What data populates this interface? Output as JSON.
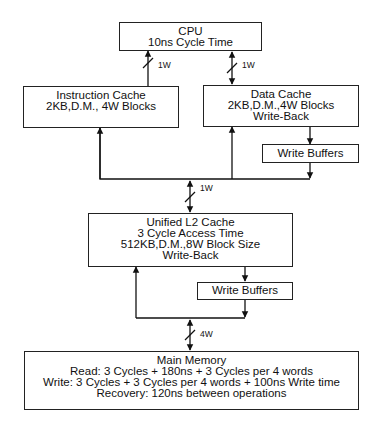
{
  "diagram": {
    "cpu": {
      "title": "CPU",
      "lines": [
        "10ns Cycle Time"
      ]
    },
    "instruction_cache": {
      "title": "Instruction Cache",
      "lines": [
        "2KB,D.M., 4W Blocks"
      ]
    },
    "data_cache": {
      "title": "Data Cache",
      "lines": [
        "2KB,D.M.,4W Blocks",
        "Write-Back"
      ]
    },
    "write_buffers_l1": {
      "title": "Write Buffers"
    },
    "l2_cache": {
      "title": "Unified L2 Cache",
      "lines": [
        "3 Cycle Access Time",
        "512KB,D.M.,8W Block Size",
        "Write-Back"
      ]
    },
    "write_buffers_l2": {
      "title": "Write Buffers"
    },
    "main_memory": {
      "title": "Main Memory",
      "lines": [
        "Read: 3 Cycles + 180ns + 3 Cycles per 4 words",
        "Write: 3 Cycles + 3 Cycles per 4 words + 100ns Write time",
        "Recovery: 120ns between operations"
      ]
    },
    "bus_labels": {
      "cpu_icache": "1W",
      "cpu_dcache": "1W",
      "l1_l2": "1W",
      "l2_mem": "4W"
    }
  }
}
